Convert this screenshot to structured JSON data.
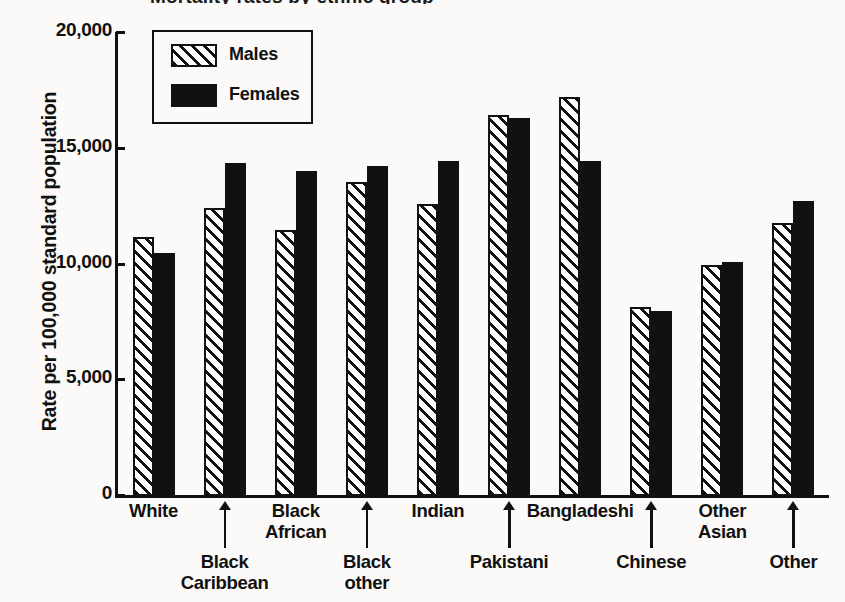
{
  "title": "Mortality rates by ethnic group",
  "axes": {
    "y_title": "Rate per 100,000 standard population",
    "y_ticks": [
      "20,000",
      "15,000",
      "10,000",
      "5,000",
      "0"
    ]
  },
  "legend": {
    "males_label": "Males",
    "females_label": "Females"
  },
  "colors": {
    "ink": "#111111",
    "paper": "#fbfaf8",
    "female_fill": "#111111",
    "male_fill": "#ffffff"
  },
  "chart_data": {
    "type": "bar",
    "title": "Mortality rates by ethnic group",
    "xlabel": "",
    "ylabel": "Rate per 100,000 standard population",
    "ylim": [
      0,
      20000
    ],
    "yticks": [
      0,
      5000,
      10000,
      15000,
      20000
    ],
    "grid": false,
    "legend_position": "top-left",
    "categories": [
      "White",
      "Black Caribbean",
      "Black African",
      "Black other",
      "Indian",
      "Pakistani",
      "Bangladeshi",
      "Chinese",
      "Other Asian",
      "Other"
    ],
    "series": [
      {
        "name": "Males",
        "values": [
          11200,
          12450,
          11500,
          13550,
          12600,
          16450,
          17250,
          8150,
          10000,
          11800
        ]
      },
      {
        "name": "Females",
        "values": [
          10500,
          14400,
          14050,
          14250,
          14450,
          16350,
          14450,
          8000,
          10100,
          12750
        ]
      }
    ]
  }
}
